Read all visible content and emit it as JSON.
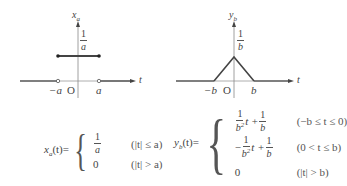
{
  "figure_left": {
    "y_axis_label": "x",
    "y_axis_sub": "a",
    "x_axis_label": "t",
    "height_label_num": "1",
    "height_label_den": "a",
    "tick_neg": "−a",
    "tick_origin": "O",
    "tick_pos": "a",
    "shape": "rectangular pulse"
  },
  "figure_right": {
    "y_axis_label": "y",
    "y_axis_sub": "b",
    "x_axis_label": "t",
    "height_label_num": "1",
    "height_label_den": "b",
    "tick_neg": "−b",
    "tick_origin": "O",
    "tick_pos": "b",
    "shape": "triangular pulse"
  },
  "eq_left": {
    "lhs_var": "x",
    "lhs_sub": "a",
    "lhs_arg": "(t)=",
    "case1_num": "1",
    "case1_den": "a",
    "case1_cond": "(|t| ≤ a)",
    "case2_val": "0",
    "case2_cond": "(|t| > a)"
  },
  "eq_right": {
    "lhs_var": "y",
    "lhs_sub": "b",
    "lhs_arg": "(t)=",
    "case1_coef_num": "1",
    "case1_coef_den": "b",
    "case1_coef_den_sup": "2",
    "case1_mid": "t +",
    "case1_const_num": "1",
    "case1_const_den": "b",
    "case1_cond": "(−b ≤ t ≤ 0)",
    "case2_sign": "−",
    "case2_coef_num": "1",
    "case2_coef_den": "b",
    "case2_coef_den_sup": "2",
    "case2_mid": "t +",
    "case2_const_num": "1",
    "case2_const_den": "b",
    "case2_cond": "(0 < t ≤ b)",
    "case3_val": "0",
    "case3_cond": "(|t| > b)"
  }
}
